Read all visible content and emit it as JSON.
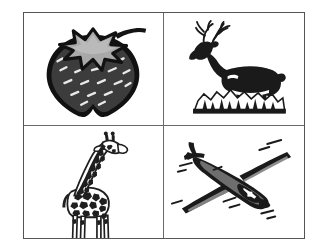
{
  "page": {
    "background_color": "#ffffff",
    "width": 322,
    "height": 251
  },
  "frame": {
    "border_color": "#555558",
    "divider_color": "#6a6a6d",
    "rows": 2,
    "columns": 2
  },
  "palette": {
    "ink": "#1a1a1a",
    "fill_dark": "#3c3c3c",
    "fill_mid": "#6e6e6e",
    "fill_light": "#a8a8a8",
    "paper": "#ffffff"
  },
  "cells": [
    {
      "position": "top-left",
      "name": "strawberry",
      "label": "Strawberry",
      "description": "Dark filled strawberry with pale star-shaped calyx and stem, white seed dashes",
      "body_color": "#3c3c3c",
      "calyx_color": "#a8a8a8",
      "outline_color": "#141414"
    },
    {
      "position": "top-right",
      "name": "deer",
      "label": "Deer",
      "description": "Antlered stag facing left standing on a rocky mound with pine trees",
      "silhouette_color": "#1a1a1a",
      "ground_color": "#1a1a1a"
    },
    {
      "position": "bottom-left",
      "name": "giraffe",
      "label": "Giraffe",
      "description": "Spotted giraffe facing right standing on a dark rectangular base",
      "spot_color": "#1f1f1f",
      "base_color": "#1a1a1a"
    },
    {
      "position": "bottom-right",
      "name": "glider",
      "label": "Glider",
      "description": "Sailplane glider in flight seen from above and behind, long slender wings",
      "outline_color": "#1a1a1a",
      "shade_color": "#4a4a4a"
    }
  ]
}
